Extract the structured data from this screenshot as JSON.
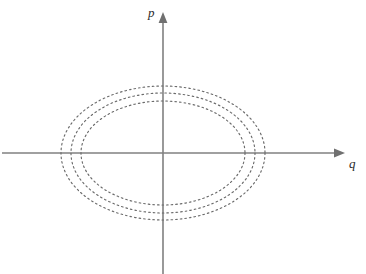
{
  "figure": {
    "title": "",
    "background_color": "#ffffff",
    "width": 366,
    "height": 274
  },
  "axes": {
    "horizontal": {
      "label": "q",
      "name": "q-axis",
      "color": "#808080",
      "x_start": 2,
      "x_end": 345,
      "y": 153,
      "arrow": "right"
    },
    "vertical": {
      "label": "p",
      "name": "p-axis",
      "color": "#808080",
      "y_start": 12,
      "y_end": 274,
      "x": 163,
      "arrow": "up"
    },
    "origin": {
      "x": 163,
      "y": 153
    }
  },
  "chart_data": {
    "type": "line",
    "title": "",
    "xlabel": "q",
    "ylabel": "p",
    "grid": false,
    "legend": null,
    "curve_style": "dotted",
    "curve_color": "#6b6b6b",
    "series": [
      {
        "name": "orbit-inner",
        "shape": "ellipse",
        "center": [
          163,
          153
        ],
        "semi_axis_q": 82,
        "semi_axis_p": 52
      },
      {
        "name": "orbit-middle",
        "shape": "ellipse",
        "center": [
          163,
          153
        ],
        "semi_axis_q": 92,
        "semi_axis_p": 60
      },
      {
        "name": "orbit-outer",
        "shape": "ellipse",
        "center": [
          163,
          153
        ],
        "semi_axis_q": 102,
        "semi_axis_p": 67
      }
    ],
    "xlim": [
      -163,
      203
    ],
    "ylim": [
      -121,
      153
    ]
  }
}
